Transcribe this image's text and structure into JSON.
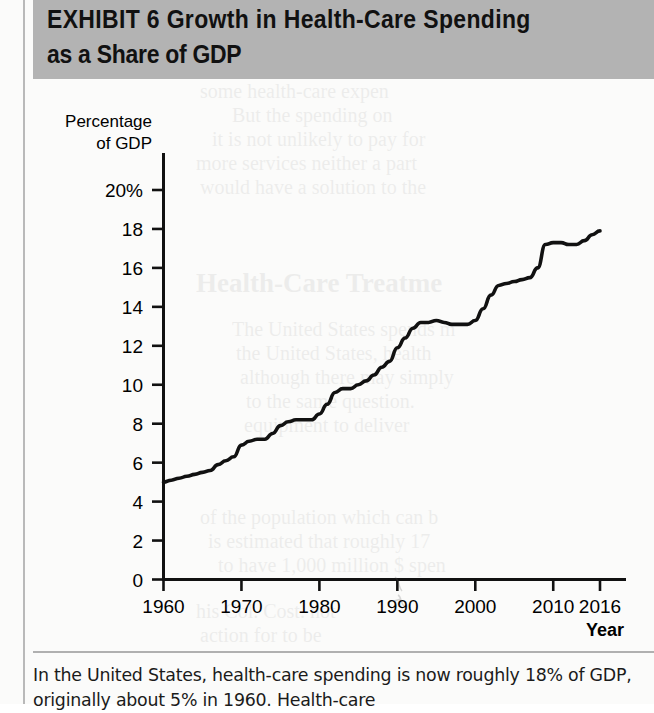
{
  "banner": {
    "exhibit_label": "EXHIBIT 6",
    "title": "Growth in Health-Care Spending as a Share of GDP",
    "title_line1": "EXHIBIT 6  Growth in Health-Care Spending",
    "title_line2": "as a Share of GDP",
    "background_color": "#b3b3b3"
  },
  "caption": {
    "line1": "In the United States, health-care spending is now roughly",
    "line2": "18% of GDP, originally about 5% in 1960. Health-care"
  },
  "chart_data": {
    "type": "line",
    "xlabel": "Year",
    "ylabel": "Percentage of GDP",
    "ylabel_line1": "Percentage",
    "ylabel_line2": "of GDP",
    "xlim": [
      1960,
      2016
    ],
    "ylim": [
      0,
      20
    ],
    "grid": false,
    "legend": null,
    "line_color": "#111111",
    "yticks": [
      0,
      2,
      4,
      6,
      8,
      10,
      12,
      14,
      16,
      18,
      20
    ],
    "ytick_labels": [
      "0",
      "2",
      "4",
      "6",
      "8",
      "10",
      "12",
      "14",
      "16",
      "18",
      "20%"
    ],
    "xticks": [
      1960,
      1970,
      1980,
      1990,
      2000,
      2010,
      2016
    ],
    "xtick_labels": [
      "1960",
      "1970",
      "1980",
      "1990",
      "2000",
      "2010",
      "2016"
    ],
    "x": [
      1960,
      1961,
      1962,
      1963,
      1964,
      1965,
      1966,
      1967,
      1968,
      1969,
      1970,
      1971,
      1972,
      1973,
      1974,
      1975,
      1976,
      1977,
      1978,
      1979,
      1980,
      1981,
      1982,
      1983,
      1984,
      1985,
      1986,
      1987,
      1988,
      1989,
      1990,
      1991,
      1992,
      1993,
      1994,
      1995,
      1996,
      1997,
      1998,
      1999,
      2000,
      2001,
      2002,
      2003,
      2004,
      2005,
      2006,
      2007,
      2008,
      2009,
      2010,
      2011,
      2012,
      2013,
      2014,
      2015,
      2016
    ],
    "values": [
      5.0,
      5.1,
      5.2,
      5.3,
      5.4,
      5.5,
      5.6,
      5.9,
      6.1,
      6.3,
      6.9,
      7.1,
      7.2,
      7.2,
      7.5,
      7.9,
      8.1,
      8.2,
      8.2,
      8.2,
      8.5,
      9.0,
      9.6,
      9.8,
      9.8,
      10.0,
      10.2,
      10.5,
      10.9,
      11.2,
      11.9,
      12.4,
      12.9,
      13.2,
      13.2,
      13.3,
      13.2,
      13.1,
      13.1,
      13.1,
      13.3,
      13.9,
      14.6,
      15.1,
      15.2,
      15.3,
      15.4,
      15.5,
      16.0,
      17.2,
      17.3,
      17.3,
      17.2,
      17.2,
      17.4,
      17.7,
      17.9
    ],
    "start_value": 5.0,
    "end_value": 17.9,
    "start_year": 1960,
    "end_year": 2016
  }
}
